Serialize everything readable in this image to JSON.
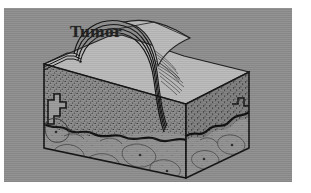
{
  "figure": {
    "name": "skin-tumor-cross-section",
    "title": "Tumor",
    "background_color": "#8d8d8d",
    "ink_color": "#1d1d1d",
    "plate": {
      "x": 4,
      "y": 8,
      "width": 288,
      "height": 174
    },
    "labels": [
      {
        "id": "tumor",
        "text": "Tumor",
        "x": 66,
        "y": 14,
        "leader_line": true
      }
    ],
    "regions": [
      {
        "id": "epidermis",
        "label": "epidermis layered surface"
      },
      {
        "id": "dermis",
        "label": "stippled dermis"
      },
      {
        "id": "subcutaneous",
        "label": "subcutaneous fat with lobules"
      },
      {
        "id": "tumor-dome",
        "label": "raised tumor mass"
      },
      {
        "id": "top-surface",
        "label": "skin top surface"
      }
    ],
    "speck": {
      "x": 283,
      "y": 1
    }
  }
}
